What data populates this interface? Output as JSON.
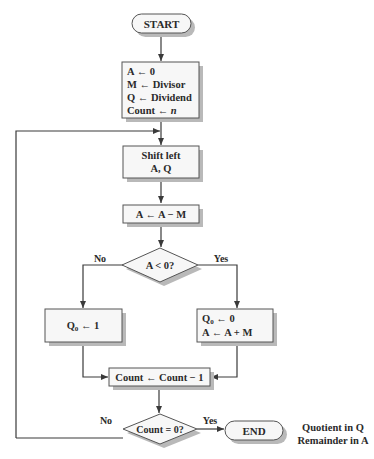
{
  "diagram": {
    "type": "flowchart",
    "nodes": {
      "start": {
        "kind": "terminator",
        "label": "START"
      },
      "init": {
        "kind": "process",
        "lines": [
          "A ← 0",
          "M ← Divisor",
          "Q ← Dividend",
          "Count ← "
        ],
        "count_var": "n"
      },
      "shift": {
        "kind": "process",
        "lines": [
          "Shift left",
          "A, Q"
        ]
      },
      "subtract": {
        "kind": "process",
        "label": "A ← A − M"
      },
      "test_a": {
        "kind": "decision",
        "label": "A < 0?"
      },
      "set_q1": {
        "kind": "process",
        "label_main": "Q",
        "label_sub": "0",
        "label_rest": " ← 1"
      },
      "restore": {
        "kind": "process",
        "line1_main": "Q",
        "line1_sub": "0",
        "line1_rest": " ← 0",
        "line2": "A ← A + M"
      },
      "decrement": {
        "kind": "process",
        "label": "Count ← Count − 1"
      },
      "test_count": {
        "kind": "decision",
        "label": "Count = 0?"
      },
      "end": {
        "kind": "terminator",
        "label": "END"
      }
    },
    "edge_labels": {
      "test_a_no": "No",
      "test_a_yes": "Yes",
      "test_count_no": "No",
      "test_count_yes": "Yes"
    },
    "annotation": [
      "Quotient in Q",
      "Remainder in A"
    ],
    "colors": {
      "shape_fill": "#f7f7f7",
      "shape_stroke": "#555555",
      "shadow": "#b9b9b9",
      "line": "#3a3a3a",
      "text": "#2a2a2a"
    }
  }
}
